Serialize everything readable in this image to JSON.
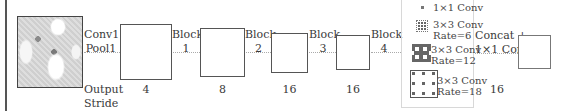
{
  "diagram": {
    "input_image": {
      "description": "input-photo"
    },
    "stages": [
      {
        "label_top": "Conv1 +",
        "label_bottom": "Pool1",
        "output_stride": "4"
      },
      {
        "label_top": "Block",
        "label_bottom": "1",
        "output_stride": "8"
      },
      {
        "label_top": "Block",
        "label_bottom": "2",
        "output_stride": "16"
      },
      {
        "label_top": "Block",
        "label_bottom": "3",
        "output_stride": "16"
      },
      {
        "label_top": "Block",
        "label_bottom": "4"
      }
    ],
    "output_stride_label": {
      "line1": "Output",
      "line2": "Stride"
    },
    "aspp": {
      "branches": [
        {
          "line1": "1×1 Conv",
          "line2": ""
        },
        {
          "line1": "3×3 Conv",
          "line2": "Rate=6"
        },
        {
          "line1": "3×3 Conv",
          "line2": "Rate=12"
        },
        {
          "line1": "3×3 Conv",
          "line2": "Rate=18"
        }
      ],
      "output_stride": "16"
    },
    "final": {
      "line1": "Concat +",
      "line2": "1×1 Conv"
    },
    "colors": {
      "box_border": "#555555",
      "arrow": "#aaaaaa",
      "text": "#3a3a3a",
      "panel_border": "#d8d8d8"
    }
  }
}
